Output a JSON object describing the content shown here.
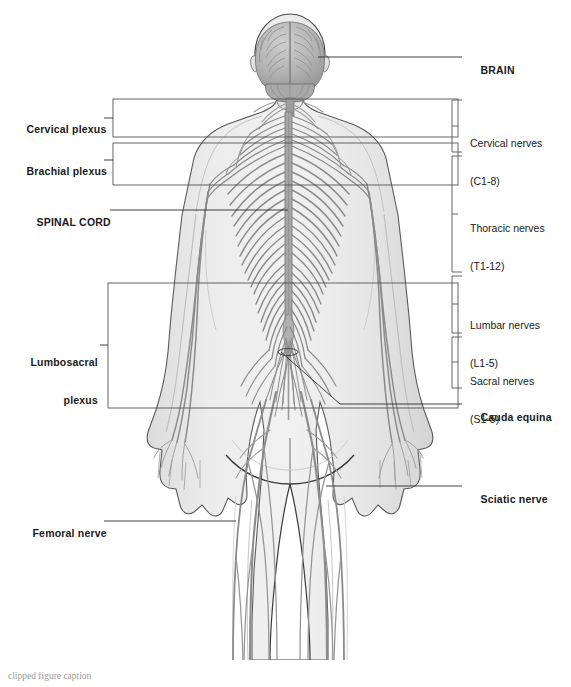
{
  "figure": {
    "view": "posterior whole-body human figure",
    "colors": {
      "body_fill": "#e9e9e9",
      "body_outline": "#4a4a4a",
      "nerve": "#8b8b8b",
      "spinal_cord": "#9a9a9a",
      "brain_fill": "#b9b9b9",
      "cerebellum_fill": "#a8a8a8",
      "leader_line": "#2b2b2b",
      "label_text": "#1a1a1a",
      "background": "#ffffff"
    }
  },
  "labels_left": [
    {
      "id": "cervical-plexus",
      "text": "Cervical plexus",
      "weight": "bold",
      "x": 14,
      "y": 115,
      "lines": [
        "Cervical plexus"
      ]
    },
    {
      "id": "brachial-plexus",
      "text": "Brachial plexus",
      "weight": "bold",
      "x": 14,
      "y": 155,
      "lines": [
        "Brachial plexus"
      ]
    },
    {
      "id": "spinal-cord",
      "text": "SPINAL CORD",
      "weight": "bold",
      "x": 24,
      "y": 210,
      "lines": [
        "SPINAL CORD"
      ]
    },
    {
      "id": "lumbosacral-plexus",
      "text": "Lumbosacral plexus",
      "weight": "bold",
      "x": 22,
      "y": 335,
      "lines": [
        "Lumbosacral",
        "plexus"
      ]
    },
    {
      "id": "femoral-nerve",
      "text": "Femoral nerve",
      "weight": "bold",
      "x": 20,
      "y": 518,
      "lines": [
        "Femoral nerve"
      ]
    }
  ],
  "labels_right": [
    {
      "id": "brain",
      "text": "BRAIN",
      "weight": "bold",
      "x": 468,
      "y": 52,
      "lines": [
        "BRAIN"
      ]
    },
    {
      "id": "cervical-nerves",
      "text": "Cervical nerves (C1-8)",
      "weight": "normal",
      "x": 470,
      "y": 113,
      "lines": [
        "Cervical nerves",
        "(C1-8)"
      ]
    },
    {
      "id": "thoracic-nerves",
      "text": "Thoracic nerves (T1-12)",
      "weight": "normal",
      "x": 470,
      "y": 198,
      "lines": [
        "Thoracic nerves",
        "(T1-12)"
      ]
    },
    {
      "id": "lumbar-nerves",
      "text": "Lumbar nerves (L1-5)",
      "weight": "normal",
      "x": 470,
      "y": 295,
      "lines": [
        "Lumbar nerves",
        "(L1-5)"
      ]
    },
    {
      "id": "sacral-nerves",
      "text": "Sacral nerves (S1-5)",
      "weight": "normal",
      "x": 470,
      "y": 351,
      "lines": [
        "Sacral nerves",
        "(S1-5)"
      ]
    },
    {
      "id": "cauda-equina",
      "text": "Cauda equina",
      "weight": "bold",
      "x": 468,
      "y": 403,
      "lines": [
        "Cauda equina"
      ]
    },
    {
      "id": "sciatic-nerve",
      "text": "Sciatic nerve",
      "weight": "bold",
      "x": 468,
      "y": 483,
      "lines": [
        "Sciatic nerve"
      ]
    }
  ],
  "brackets_right": [
    {
      "id": "bracket-cervical",
      "x": 452,
      "y_top": 100,
      "y_bottom": 152,
      "label_ref": "cervical-nerves"
    },
    {
      "id": "bracket-thoracic",
      "x": 452,
      "y_top": 156,
      "y_bottom": 272,
      "label_ref": "thoracic-nerves"
    },
    {
      "id": "bracket-lumbar",
      "x": 452,
      "y_top": 276,
      "y_bottom": 333,
      "label_ref": "lumbar-nerves"
    },
    {
      "id": "bracket-sacral",
      "x": 452,
      "y_top": 337,
      "y_bottom": 388,
      "label_ref": "sacral-nerves"
    }
  ],
  "callout_boxes": [
    {
      "id": "box-cervical-plexus",
      "x": 113,
      "y": 99,
      "w": 345,
      "h": 38
    },
    {
      "id": "box-brachial-plexus",
      "x": 113,
      "y": 143,
      "w": 345,
      "h": 42
    },
    {
      "id": "box-lumbosacral-plexus",
      "x": 108,
      "y": 283,
      "w": 350,
      "h": 125
    }
  ],
  "leader_lines": [
    {
      "id": "leader-brain",
      "points": "340,57 462,57"
    },
    {
      "id": "leader-spinal-cord",
      "points": "110,210 290,210"
    },
    {
      "id": "leader-cauda-equina",
      "points": "281,355 340,404 462,404"
    },
    {
      "id": "leader-sciatic-nerve",
      "points": "330,486 462,486"
    },
    {
      "id": "leader-femoral-nerve",
      "points": "110,521 290,521"
    }
  ],
  "caption": {
    "text": "clipped figure caption",
    "visible": false
  }
}
